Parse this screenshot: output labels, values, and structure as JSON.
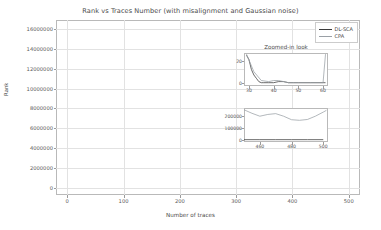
{
  "chart_data": {
    "type": "line",
    "title": "Rank vs Traces Number (with misalignment and Gaussian noise)",
    "xlabel": "Number of traces",
    "ylabel": "Rank",
    "xlim": [
      -20,
      520
    ],
    "ylim": [
      -700000,
      16900000
    ],
    "xticks": [
      0,
      100,
      200,
      300,
      400,
      500
    ],
    "xticklabels": [
      "0",
      "100",
      "200",
      "300",
      "400",
      "500"
    ],
    "yticks": [
      0,
      2000000,
      4000000,
      6000000,
      8000000,
      10000000,
      12000000,
      14000000,
      16000000
    ],
    "yticklabels": [
      "0",
      "2000000",
      "4000000",
      "6000000",
      "8000000",
      "10000000",
      "12000000",
      "14000000",
      "16000000"
    ],
    "grid": true,
    "legend_position": "upper right",
    "colors": {
      "dlsca": "#3a3a3a",
      "cpa": "#9aa0a6",
      "grid": "#e2e2e2",
      "frame": "#b9b9b9",
      "text": "#4a4a4a"
    },
    "series": [
      {
        "name": "DL-SCA",
        "color": "#3a3a3a",
        "x": [
          0,
          4,
          6,
          8,
          10,
          12,
          14,
          16,
          18,
          20,
          24,
          28,
          32,
          36,
          40,
          60,
          100,
          150,
          200,
          250,
          300,
          350,
          400,
          450,
          500
        ],
        "values": [
          6300000,
          300000,
          120000,
          60000,
          900000,
          180000,
          60000,
          1000000,
          250000,
          60000,
          20000,
          5000,
          0,
          0,
          0,
          0,
          0,
          0,
          0,
          0,
          0,
          0,
          0,
          0,
          0
        ]
      },
      {
        "name": "CPA",
        "color": "#9aa0a6",
        "x": [
          0,
          5,
          10,
          15,
          20,
          25,
          30,
          35,
          40,
          45,
          50,
          55,
          60,
          65,
          70,
          75,
          80,
          85,
          90,
          95,
          100,
          105,
          110,
          115,
          120,
          125,
          130,
          135,
          140,
          145,
          150,
          155,
          160,
          165,
          170,
          175,
          180,
          185,
          190,
          195,
          200,
          205,
          210,
          215,
          220,
          225,
          230,
          235,
          240,
          245,
          250,
          255,
          260,
          265,
          270,
          275,
          280,
          285,
          290,
          295,
          300,
          305,
          310,
          315,
          320,
          325,
          330,
          335,
          340,
          345,
          350,
          355,
          360,
          365,
          370,
          375,
          380,
          385,
          390,
          395,
          400,
          405,
          410,
          415,
          420,
          425,
          430,
          435,
          440,
          445,
          450,
          460,
          470,
          480,
          490,
          500
        ],
        "values": [
          6400000,
          14000000,
          16800000,
          16300000,
          13000000,
          9500000,
          6000000,
          3000000,
          900000,
          4200000,
          8500000,
          11200000,
          12600000,
          10400000,
          12000000,
          15600000,
          13000000,
          9000000,
          5000000,
          2400000,
          700000,
          7000000,
          13500000,
          15500000,
          11500000,
          8400000,
          6800000,
          8500000,
          10200000,
          5000000,
          800000,
          3500000,
          6400000,
          3200000,
          1800000,
          4200000,
          2500000,
          6500000,
          3800000,
          1500000,
          2600000,
          1300000,
          600000,
          2600000,
          8400000,
          3500000,
          700000,
          1800000,
          2600000,
          2700000,
          2700000,
          2100000,
          1400000,
          700000,
          250000,
          200000,
          600000,
          400000,
          200000,
          1600000,
          3300000,
          1000000,
          1700000,
          2200000,
          3900000,
          2700000,
          2400000,
          2600000,
          2400000,
          1400000,
          400000,
          400000,
          600000,
          800000,
          900000,
          1000000,
          1100000,
          1000000,
          600000,
          200000,
          100000,
          200000,
          700000,
          1100000,
          1400000,
          700000,
          300000,
          250000,
          250000,
          250000,
          220000,
          200000,
          180000,
          160000,
          170000,
          200000
        ]
      }
    ],
    "legend": [
      {
        "label": "DL-SCA",
        "color": "#3a3a3a"
      },
      {
        "label": "CPA",
        "color": "#9aa0a6"
      }
    ],
    "insets": [
      {
        "id": "inset-top",
        "title": "Zoomed-in look",
        "xlim": [
          28,
          62
        ],
        "ylim": [
          -3,
          27
        ],
        "xticks": [
          30,
          40,
          50,
          60
        ],
        "xticklabels": [
          "30",
          "40",
          "50",
          "60"
        ],
        "yticks": [
          0,
          20
        ],
        "yticklabels": [
          "0",
          "20"
        ],
        "series": [
          {
            "name": "DL-SCA",
            "color": "#3a3a3a",
            "x": [
              29,
              30,
              31,
              32,
              33,
              34,
              35,
              36,
              38,
              40,
              42,
              44,
              46,
              48,
              50,
              55,
              60,
              61
            ],
            "values": [
              25,
              21,
              12,
              7,
              4,
              1,
              0,
              0,
              0,
              0,
              1,
              1,
              0,
              0,
              0,
              0,
              0,
              0
            ]
          },
          {
            "name": "CPA",
            "color": "#9aa0a6",
            "x": [
              29,
              32,
              35,
              38,
              40,
              42,
              44,
              46,
              50,
              55,
              60,
              61
            ],
            "values": [
              26,
              10,
              2,
              1,
              2,
              2,
              1,
              0,
              0,
              0,
              0,
              26
            ]
          }
        ]
      },
      {
        "id": "inset-bottom",
        "title": "",
        "xlim": [
          450,
          503
        ],
        "ylim": [
          -20000,
          270000
        ],
        "xticks": [
          460,
          480,
          500
        ],
        "xticklabels": [
          "460",
          "480",
          "500"
        ],
        "yticks": [
          0,
          100000,
          200000
        ],
        "yticklabels": [
          "0",
          "100000",
          "200000"
        ],
        "series": [
          {
            "name": "DL-SCA",
            "color": "#3a3a3a",
            "x": [
              450,
              460,
              470,
              480,
              490,
              500
            ],
            "values": [
              0,
              0,
              0,
              0,
              0,
              0
            ]
          },
          {
            "name": "CPA",
            "color": "#9aa0a6",
            "x": [
              450,
              455,
              460,
              465,
              470,
              475,
              480,
              485,
              490,
              495,
              500,
              502
            ],
            "values": [
              255000,
              225000,
              200000,
              215000,
              222000,
              200000,
              170000,
              165000,
              172000,
              200000,
              235000,
              250000
            ]
          }
        ]
      }
    ]
  }
}
